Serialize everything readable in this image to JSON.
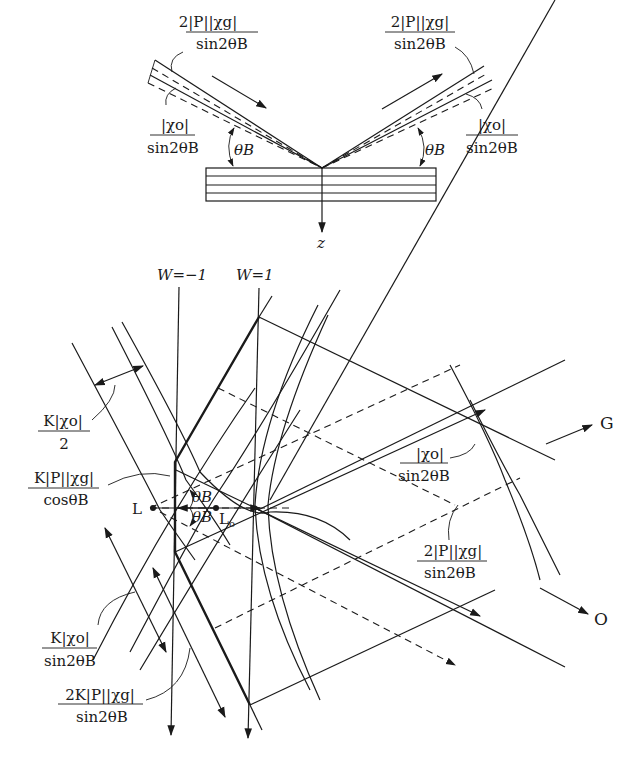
{
  "figure": {
    "top_panel": {
      "incident_upper_label": {
        "num": "2|P||χg|",
        "den": "sin2θB"
      },
      "incident_lower_label": {
        "num": "|χo|",
        "den": "sin2θB"
      },
      "reflected_upper_label": {
        "num": "2|P||χg|",
        "den": "sin2θB"
      },
      "reflected_lower_label": {
        "num": "|χo|",
        "den": "sin2θB"
      },
      "angle_left": "θB",
      "angle_right": "θB",
      "axis_label": "z"
    },
    "bottom_panel": {
      "w_minus_label": "W=−1",
      "w_plus_label": "W=1",
      "label_k_chi0_half": {
        "num": "K|χo|",
        "den": "2"
      },
      "label_k_p_chig_cos": {
        "num": "K|P||χg|",
        "den": "cosθB"
      },
      "label_k_chi0_sin": {
        "num": "K|χo|",
        "den": "sin2θB"
      },
      "label_2k_p_chig_sin": {
        "num": "2K|P||χg|",
        "den": "sin2θB"
      },
      "label_chi0_sin_right": {
        "num": "|χo|",
        "den": "sin2θB"
      },
      "label_2p_chig_sin_right": {
        "num": "2|P||χg|",
        "den": "sin2θB"
      },
      "point_L": "L",
      "point_L0": "L",
      "point_L0_sub": "o",
      "angle_upper": "θB",
      "angle_lower": "θB",
      "direction_G": "G",
      "direction_O": "O"
    }
  }
}
